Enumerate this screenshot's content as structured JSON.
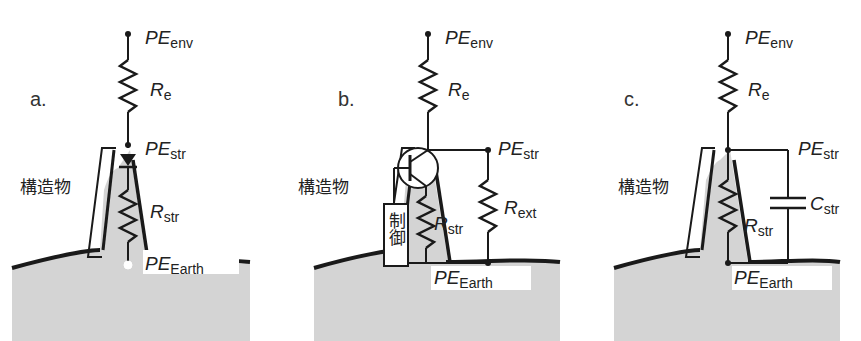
{
  "figure": {
    "panels": [
      {
        "id": "a",
        "letter": "a.",
        "structure_label": "構造物",
        "labels": {
          "pe_env": {
            "main": "PE",
            "sub": "env"
          },
          "r_e": {
            "main": "R",
            "sub": "e"
          },
          "pe_str": {
            "main": "PE",
            "sub": "str"
          },
          "r_str": {
            "main": "R",
            "sub": "str"
          },
          "pe_earth": {
            "main": "PE",
            "sub": "Earth"
          }
        },
        "component": "diode"
      },
      {
        "id": "b",
        "letter": "b.",
        "structure_label": "構造物",
        "control_label": "制御",
        "labels": {
          "pe_env": {
            "main": "PE",
            "sub": "env"
          },
          "r_e": {
            "main": "R",
            "sub": "e"
          },
          "pe_str": {
            "main": "PE",
            "sub": "str"
          },
          "r_str": {
            "main": "R",
            "sub": "str"
          },
          "r_ext": {
            "main": "R",
            "sub": "ext"
          },
          "pe_earth": {
            "main": "PE",
            "sub": "Earth"
          }
        },
        "component": "transistor"
      },
      {
        "id": "c",
        "letter": "c.",
        "structure_label": "構造物",
        "labels": {
          "pe_env": {
            "main": "PE",
            "sub": "env"
          },
          "r_e": {
            "main": "R",
            "sub": "e"
          },
          "pe_str": {
            "main": "PE",
            "sub": "str"
          },
          "r_str": {
            "main": "R",
            "sub": "str"
          },
          "c_str": {
            "main": "C",
            "sub": "str"
          },
          "pe_earth": {
            "main": "PE",
            "sub": "Earth"
          }
        },
        "component": "capacitor"
      }
    ],
    "colors": {
      "ground_fill": "#d4d4d4",
      "line": "#1a1a1a",
      "background": "#ffffff"
    }
  }
}
